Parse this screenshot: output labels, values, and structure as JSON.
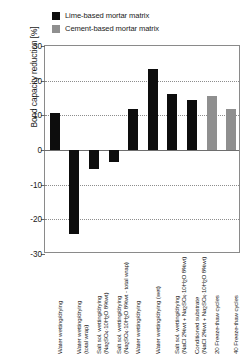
{
  "chart_data": {
    "type": "bar",
    "title": "",
    "xlabel": "",
    "ylabel": "Bond capacity reduction [%]",
    "ylim": [
      -30,
      30
    ],
    "yticks": [
      30,
      20,
      10,
      0,
      -10,
      -20,
      -30
    ],
    "grid": "horizontal-dotted",
    "legend_position": "top-center",
    "legend": [
      {
        "label": "Lime-based mortar matrix",
        "color": "#0d0d0d"
      },
      {
        "label": "Cement-based mortar matrix",
        "color": "#8f8f8f"
      }
    ],
    "categories": [
      "Water wetting/drying",
      "Water wetting/drying (total wrap)",
      "Salt sol. wetting/drying (Na2SO4·10H2O 8%wt)",
      "Salt sol. wetting/drying (Na2SO4·10H2O 8%wt - total wrap)",
      "Water wetting/drying",
      "Water wetting/drying (wet)",
      "Salt sol. wetting/drying (NaCl 2%wt + Na2SO4·10H2O 8%wt)",
      "Conditioned substrate (NaCl 2%wt + Na2SO4·10H2O 8%wt)",
      "20 Freeze-thaw cycles",
      "40 Freeze-thaw cycles"
    ],
    "series": [
      {
        "name": "Lime-based mortar matrix",
        "color": "#0d0d0d",
        "values": [
          10.8,
          -24.2,
          -5.4,
          -3.5,
          11.9,
          23.4,
          16.1,
          14.4,
          null,
          null
        ]
      },
      {
        "name": "Cement-based mortar matrix",
        "color": "#8f8f8f",
        "values": [
          null,
          null,
          null,
          null,
          null,
          null,
          null,
          null,
          15.7,
          11.9
        ]
      }
    ],
    "values": [
      10.8,
      -24.2,
      -5.4,
      -3.5,
      11.9,
      23.4,
      16.1,
      14.4,
      15.7,
      11.9
    ],
    "bar_colors": [
      "#0d0d0d",
      "#0d0d0d",
      "#0d0d0d",
      "#0d0d0d",
      "#0d0d0d",
      "#0d0d0d",
      "#0d0d0d",
      "#0d0d0d",
      "#8f8f8f",
      "#8f8f8f"
    ]
  },
  "legend": {
    "items": [
      {
        "label": "Lime-based mortar matrix",
        "color": "#0d0d0d"
      },
      {
        "label": "Cement-based mortar matrix",
        "color": "#8f8f8f"
      }
    ]
  },
  "axis": {
    "ylabel": "Bond capacity reduction [%]",
    "yticks": [
      "30",
      "20",
      "10",
      "0",
      "-10",
      "-20",
      "-30"
    ]
  },
  "xlabels": [
    {
      "line1": "Water wetting/drying",
      "line2": ""
    },
    {
      "line1": "Water wetting/drying",
      "line2": "(total wrap)"
    },
    {
      "line1": "Salt sol. wetting/drying",
      "line2": "(Na2SO4·10H2O 8%wt)"
    },
    {
      "line1": "Salt sol. wetting/drying",
      "line2": "(Na2SO4·10H2O 8%wt - total wrap)"
    },
    {
      "line1": "Water wetting/drying",
      "line2": ""
    },
    {
      "line1": "Water wetting/drying (wet)",
      "line2": ""
    },
    {
      "line1": "Salt sol. wetting/drying",
      "line2": "(NaCl 2%wt + Na2SO4·10H2O 8%wt)"
    },
    {
      "line1": "Conditioned substrate",
      "line2": "(NaCl 2%wt + Na2SO4·10H2O 8%wt)"
    },
    {
      "line1": "20 Freeze-thaw cycles",
      "line2": ""
    },
    {
      "line1": "40 Freeze-thaw cycles",
      "line2": ""
    }
  ]
}
